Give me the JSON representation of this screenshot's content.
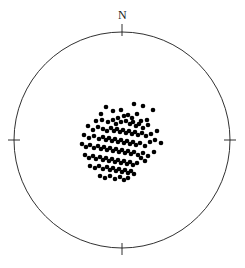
{
  "figure": {
    "type": "stereonet",
    "projection": "equal-area lower hemisphere",
    "background_color": "#ffffff",
    "labels": {
      "north": "N"
    }
  },
  "chart_data": {
    "type": "scatter",
    "title": "",
    "subtitle": "",
    "xlabel": "",
    "ylabel": "",
    "projection": "stereonet-equal-area",
    "grid": false,
    "legend": null,
    "annotations": [
      {
        "text": "N",
        "position": "top-outside",
        "x": 122,
        "y": 15
      }
    ],
    "axis_ticks": [
      {
        "label": "N",
        "angle_deg": 0,
        "x": 122,
        "y": 32
      },
      {
        "label": "",
        "angle_deg": 90,
        "x": 230,
        "y": 140
      },
      {
        "label": "",
        "angle_deg": 180,
        "x": 122,
        "y": 248
      },
      {
        "label": "",
        "angle_deg": 270,
        "x": 14,
        "y": 140
      }
    ],
    "primitive_circle": {
      "center_x": 122,
      "center_y": 140,
      "radius": 108,
      "stroke": "#1a1a1a",
      "stroke_width": 0.9,
      "fill": "none"
    },
    "marker": {
      "shape": "circle",
      "radius": 2.3,
      "fill": "#000000",
      "stroke": "none"
    },
    "n_points": 126,
    "points": [
      [
        106,
        107
      ],
      [
        101,
        114
      ],
      [
        113,
        111
      ],
      [
        121,
        110
      ],
      [
        134,
        104
      ],
      [
        143,
        106
      ],
      [
        153,
        110
      ],
      [
        118,
        118
      ],
      [
        124,
        116
      ],
      [
        128,
        115
      ],
      [
        132,
        118
      ],
      [
        137,
        114
      ],
      [
        141,
        121
      ],
      [
        147,
        120
      ],
      [
        96,
        121
      ],
      [
        102,
        120
      ],
      [
        108,
        122
      ],
      [
        113,
        120
      ],
      [
        116,
        124
      ],
      [
        121,
        122
      ],
      [
        126,
        121
      ],
      [
        130,
        124
      ],
      [
        133,
        122
      ],
      [
        136,
        126
      ],
      [
        139,
        124
      ],
      [
        143,
        128
      ],
      [
        148,
        125
      ],
      [
        88,
        126
      ],
      [
        93,
        130
      ],
      [
        98,
        127
      ],
      [
        103,
        129
      ],
      [
        107,
        131
      ],
      [
        111,
        128
      ],
      [
        114,
        131
      ],
      [
        117,
        129
      ],
      [
        120,
        132
      ],
      [
        123,
        130
      ],
      [
        126,
        133
      ],
      [
        129,
        131
      ],
      [
        132,
        134
      ],
      [
        135,
        132
      ],
      [
        138,
        135
      ],
      [
        142,
        133
      ],
      [
        146,
        136
      ],
      [
        151,
        134
      ],
      [
        157,
        131
      ],
      [
        84,
        135
      ],
      [
        89,
        138
      ],
      [
        94,
        136
      ],
      [
        99,
        139
      ],
      [
        103,
        137
      ],
      [
        106,
        140
      ],
      [
        109,
        138
      ],
      [
        112,
        141
      ],
      [
        115,
        139
      ],
      [
        118,
        142
      ],
      [
        121,
        140
      ],
      [
        124,
        143
      ],
      [
        127,
        141
      ],
      [
        130,
        144
      ],
      [
        133,
        142
      ],
      [
        136,
        145
      ],
      [
        140,
        143
      ],
      [
        145,
        146
      ],
      [
        150,
        142
      ],
      [
        155,
        140
      ],
      [
        161,
        143
      ],
      [
        82,
        144
      ],
      [
        86,
        147
      ],
      [
        90,
        145
      ],
      [
        94,
        148
      ],
      [
        98,
        146
      ],
      [
        101,
        149
      ],
      [
        104,
        147
      ],
      [
        107,
        150
      ],
      [
        110,
        148
      ],
      [
        113,
        151
      ],
      [
        116,
        149
      ],
      [
        119,
        152
      ],
      [
        122,
        150
      ],
      [
        125,
        153
      ],
      [
        128,
        151
      ],
      [
        131,
        154
      ],
      [
        134,
        152
      ],
      [
        138,
        155
      ],
      [
        143,
        153
      ],
      [
        148,
        156
      ],
      [
        154,
        152
      ],
      [
        85,
        155
      ],
      [
        89,
        158
      ],
      [
        93,
        156
      ],
      [
        96,
        159
      ],
      [
        100,
        157
      ],
      [
        103,
        160
      ],
      [
        106,
        158
      ],
      [
        109,
        161
      ],
      [
        112,
        159
      ],
      [
        115,
        162
      ],
      [
        118,
        160
      ],
      [
        121,
        163
      ],
      [
        124,
        161
      ],
      [
        127,
        164
      ],
      [
        130,
        162
      ],
      [
        133,
        165
      ],
      [
        137,
        163
      ],
      [
        141,
        158
      ],
      [
        145,
        161
      ],
      [
        90,
        166
      ],
      [
        95,
        168
      ],
      [
        99,
        166
      ],
      [
        103,
        169
      ],
      [
        107,
        167
      ],
      [
        110,
        170
      ],
      [
        113,
        168
      ],
      [
        116,
        171
      ],
      [
        119,
        169
      ],
      [
        122,
        172
      ],
      [
        125,
        170
      ],
      [
        128,
        173
      ],
      [
        131,
        171
      ],
      [
        134,
        174
      ],
      [
        100,
        176
      ],
      [
        105,
        178
      ],
      [
        110,
        176
      ],
      [
        115,
        179
      ],
      [
        120,
        177
      ],
      [
        124,
        180
      ],
      [
        128,
        178
      ]
    ]
  }
}
